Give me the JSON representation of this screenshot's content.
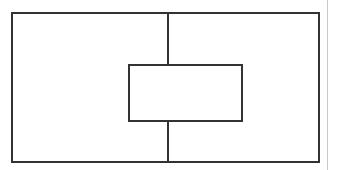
{
  "figure": {
    "title": "",
    "caption": "",
    "background_color": "#ffffff",
    "width": 337,
    "height": 170
  },
  "shapes": {
    "outer_rect": {
      "label": "",
      "stroke_color": "#333333",
      "fill_color": "none",
      "stroke_width": 2,
      "x": 11,
      "y": 12,
      "width": 309,
      "height": 151
    },
    "divider_line": {
      "label": "",
      "stroke_color": "#333333",
      "stroke_width": 2,
      "x": 167,
      "y": 12,
      "length": 151,
      "orientation": "vertical"
    },
    "inner_rect": {
      "label": "",
      "stroke_color": "#333333",
      "fill_color": "#ffffff",
      "stroke_width": 2,
      "x": 128,
      "y": 64,
      "width": 115,
      "height": 58
    },
    "page_edge_line": {
      "label": "",
      "stroke_color": "#c8c8c8",
      "stroke_width": 1,
      "x": 327,
      "y": 0,
      "length": 170,
      "orientation": "vertical"
    }
  }
}
